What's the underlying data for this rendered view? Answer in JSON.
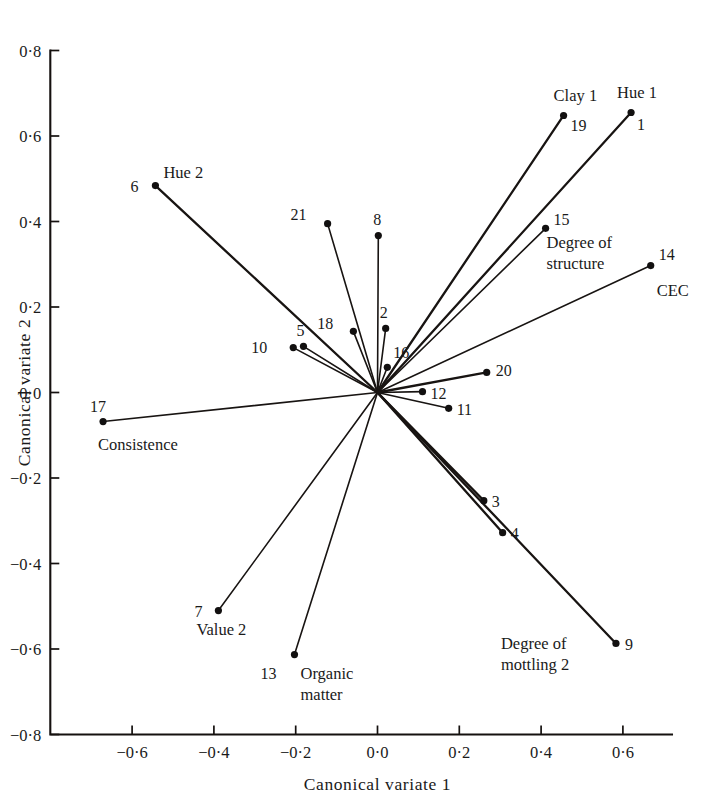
{
  "chart_data": {
    "type": "scatter",
    "title": "",
    "xlabel": "Canonical variate 1",
    "ylabel": "Canonical variate 2",
    "xlim": [
      -0.8,
      0.72
    ],
    "ylim": [
      -0.8,
      0.8
    ],
    "grid": false,
    "legend": "none",
    "origin": [
      0.0,
      0.0
    ],
    "xticks": [
      "-0.6",
      "-0.4",
      "-0.2",
      "0.0",
      "0.2",
      "0.4",
      "0.6"
    ],
    "xtickvalues": [
      -0.6,
      -0.4,
      -0.2,
      0.0,
      0.2,
      0.4,
      0.6
    ],
    "yticks": [
      "0.8",
      "0.6",
      "0.4",
      "0.2",
      "0.0",
      "-0.2",
      "-0.4",
      "-0.6",
      "-0.8"
    ],
    "ytickvalues": [
      0.8,
      0.6,
      0.4,
      0.2,
      0.0,
      -0.2,
      -0.4,
      -0.6,
      -0.8
    ],
    "points": [
      {
        "id": "1",
        "x": 0.62,
        "y": 0.655,
        "name": "Hue 1",
        "num_dx": 6,
        "num_dy": 18,
        "name_dx": -14,
        "name_dy": -14
      },
      {
        "id": "2",
        "x": 0.02,
        "y": 0.15,
        "name": "",
        "num_dx": -2,
        "num_dy": -10,
        "name_dx": 0,
        "name_dy": 0
      },
      {
        "id": "3",
        "x": 0.26,
        "y": -0.253,
        "name": "",
        "num_dx": 8,
        "num_dy": 6,
        "name_dx": 0,
        "name_dy": 0
      },
      {
        "id": "4",
        "x": 0.306,
        "y": -0.328,
        "name": "",
        "num_dx": 8,
        "num_dy": 6,
        "name_dx": 0,
        "name_dy": 0
      },
      {
        "id": "5",
        "x": -0.181,
        "y": 0.108,
        "name": "",
        "num_dx": -3,
        "num_dy": -10,
        "name_dx": 0,
        "name_dy": 0
      },
      {
        "id": "6",
        "x": -0.543,
        "y": 0.484,
        "name": "Hue 2",
        "num_dx": -17,
        "num_dy": 6,
        "name_dx": 8,
        "name_dy": -8
      },
      {
        "id": "7",
        "x": -0.389,
        "y": -0.51,
        "name": "Value 2",
        "num_dx": -16,
        "num_dy": 6,
        "name_dx": -22,
        "name_dy": 24
      },
      {
        "id": "8",
        "x": 0.002,
        "y": 0.367,
        "name": "",
        "num_dx": -1,
        "num_dy": -11,
        "name_dx": 0,
        "name_dy": 0
      },
      {
        "id": "9",
        "x": 0.583,
        "y": -0.587,
        "name": "Degree of mottling 2",
        "num_dx": 9,
        "num_dy": 7,
        "name_dx": -115,
        "name_dy": 6
      },
      {
        "id": "10",
        "x": -0.206,
        "y": 0.105,
        "name": "",
        "num_dx": -26,
        "num_dy": 5,
        "name_dx": 0,
        "name_dy": 0
      },
      {
        "id": "11",
        "x": 0.174,
        "y": -0.037,
        "name": "",
        "num_dx": 8,
        "num_dy": 7,
        "name_dx": 0,
        "name_dy": 0
      },
      {
        "id": "12",
        "x": 0.11,
        "y": 0.002,
        "name": "",
        "num_dx": 8,
        "num_dy": 7,
        "name_dx": 0,
        "name_dy": 0
      },
      {
        "id": "13",
        "x": -0.203,
        "y": -0.613,
        "name": "Organic matter",
        "num_dx": -18,
        "num_dy": 24,
        "name_dx": 6,
        "name_dy": 24
      },
      {
        "id": "14",
        "x": 0.668,
        "y": 0.297,
        "name": "CEC",
        "num_dx": 8,
        "num_dy": -6,
        "name_dx": 6,
        "name_dy": 30
      },
      {
        "id": "15",
        "x": 0.411,
        "y": 0.384,
        "name": "Degree of structure",
        "num_dx": 8,
        "num_dy": -3,
        "name_dx": 1,
        "name_dy": 20
      },
      {
        "id": "16",
        "x": 0.024,
        "y": 0.059,
        "name": "",
        "num_dx": 6,
        "num_dy": -9,
        "name_dx": 0,
        "name_dy": 0
      },
      {
        "id": "17",
        "x": -0.671,
        "y": -0.068,
        "name": "Consistence",
        "num_dx": -5,
        "num_dy": -10,
        "name_dx": -5,
        "name_dy": 28
      },
      {
        "id": "18",
        "x": -0.059,
        "y": 0.143,
        "name": "",
        "num_dx": -20,
        "num_dy": -2,
        "name_dx": 0,
        "name_dy": 0
      },
      {
        "id": "19",
        "x": 0.455,
        "y": 0.648,
        "name": "Clay 1",
        "num_dx": 7,
        "num_dy": 16,
        "name_dx": -10,
        "name_dy": -14
      },
      {
        "id": "20",
        "x": 0.267,
        "y": 0.047,
        "name": "",
        "num_dx": 9,
        "num_dy": 4,
        "name_dx": 0,
        "name_dy": 0
      },
      {
        "id": "21",
        "x": -0.122,
        "y": 0.395,
        "name": "",
        "num_dx": -21,
        "num_dy": -4,
        "name_dx": 0,
        "name_dy": 0
      }
    ],
    "label_overrides": {
      "9_line1": "Degree of",
      "9_line2": "mottling 2",
      "13_line1": "Organic",
      "13_line2": "matter",
      "15_line1": "Degree of",
      "15_line2": "structure"
    }
  },
  "axes": {
    "x_title": "Canonical variate 1",
    "y_title": "Canonical variate 2"
  }
}
